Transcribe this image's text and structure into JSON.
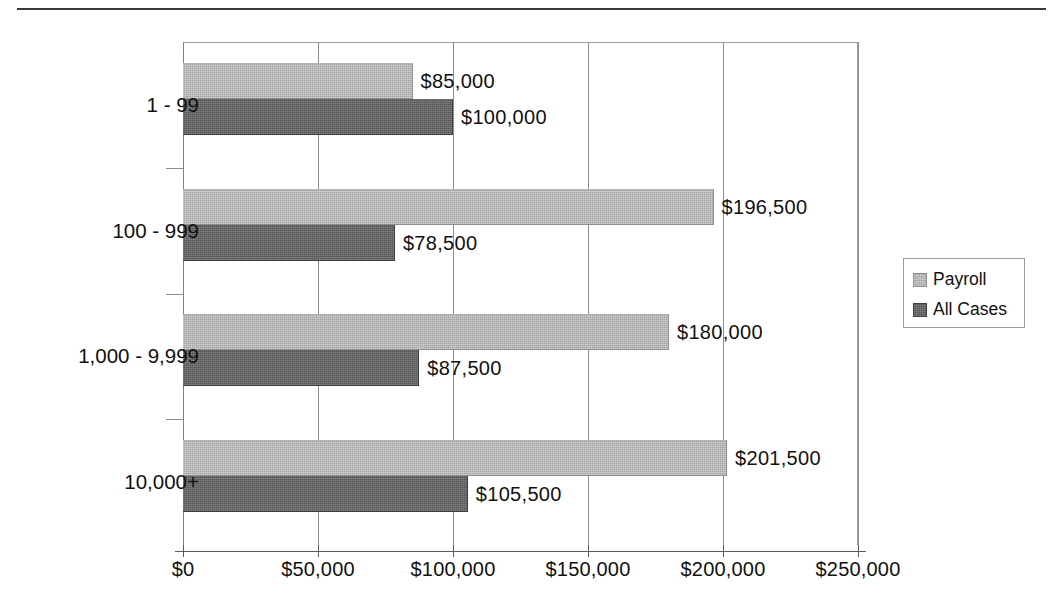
{
  "chart_data": {
    "type": "bar",
    "orientation": "horizontal",
    "title": "",
    "subtitle": "",
    "xlabel": "",
    "ylabel": "",
    "categories": [
      "1 - 99",
      "100 - 999",
      "1,000 - 9,999",
      "10,000+"
    ],
    "series": [
      {
        "name": "Payroll",
        "color": "#a3a3a3",
        "values": [
          85000,
          196500,
          180000,
          201500
        ],
        "labels": [
          "$85,000",
          "$196,500",
          "$180,000",
          "$201,500"
        ]
      },
      {
        "name": "All Cases",
        "color": "#555555",
        "values": [
          100000,
          78500,
          87500,
          105500
        ],
        "labels": [
          "$100,000",
          "$78,500",
          "$87,500",
          "$105,500"
        ]
      }
    ],
    "xlim": [
      0,
      250000
    ],
    "xticks": [
      0,
      50000,
      100000,
      150000,
      200000,
      250000
    ],
    "xticklabels": [
      "$0",
      "$50,000",
      "$100,000",
      "$150,000",
      "$200,000",
      "$250,000"
    ],
    "grid": true,
    "grid_axis": "x",
    "legend_position": "right"
  },
  "legend": {
    "entries": [
      {
        "label": "Payroll",
        "swatch": "payroll"
      },
      {
        "label": "All Cases",
        "swatch": "allcases"
      }
    ]
  }
}
